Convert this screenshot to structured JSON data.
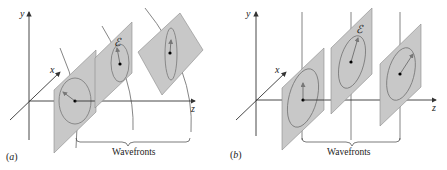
{
  "panels": [
    {
      "id": "a",
      "label": "(a)",
      "caption": "Wavefronts",
      "field_label": "ℰ"
    },
    {
      "id": "b",
      "label": "(b)",
      "caption": "Wavefronts",
      "field_label": "ℰ"
    }
  ],
  "axes": {
    "x": "x",
    "y": "y",
    "z": "z"
  },
  "colors": {
    "plane": "#c8c8c8",
    "plane_edge": "#8a8a8a",
    "line": "#555555",
    "axis": "#333333"
  }
}
